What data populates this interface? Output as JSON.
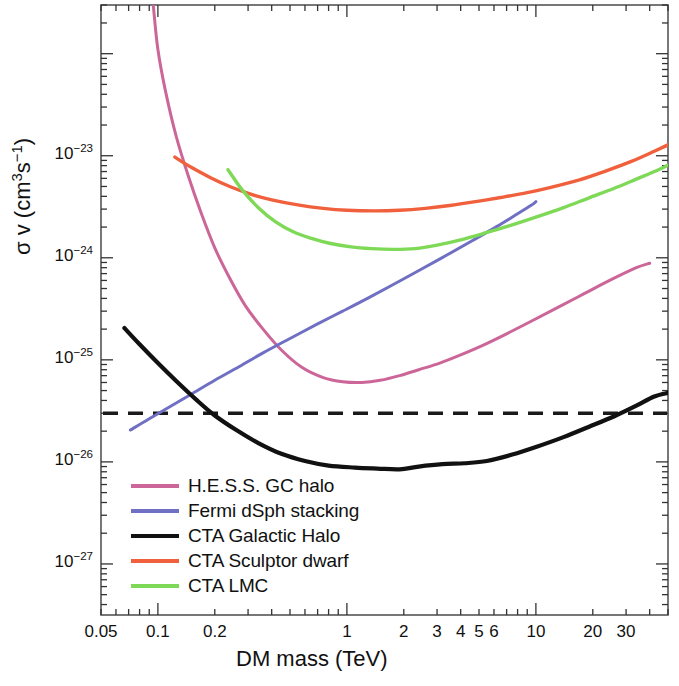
{
  "chart_data": {
    "type": "line",
    "title": "",
    "xlabel": "DM mass (TeV)",
    "ylabel": "σ v (cm3s-1)",
    "ylabel_parts": {
      "sigma": "σ v (cm",
      "exp3": "3",
      "s": "s",
      "expm1": "-1",
      "close": ")"
    },
    "xscale": "log",
    "yscale": "log",
    "xlim": [
      0.05,
      50
    ],
    "ylim": [
      3.16e-28,
      3e-22
    ],
    "grid": false,
    "legend_position": "lower left",
    "xticks": [
      {
        "value": 0.05,
        "label": "0.05"
      },
      {
        "value": 0.1,
        "label": "0.1"
      },
      {
        "value": 0.2,
        "label": "0.2"
      },
      {
        "value": 1,
        "label": "1"
      },
      {
        "value": 2,
        "label": "2"
      },
      {
        "value": 3,
        "label": "3"
      },
      {
        "value": 4,
        "label": "4"
      },
      {
        "value": 5,
        "label": "5"
      },
      {
        "value": 6,
        "label": "6"
      },
      {
        "value": 10,
        "label": "10"
      },
      {
        "value": 20,
        "label": "20"
      },
      {
        "value": 30,
        "label": "30"
      }
    ],
    "yticks": [
      {
        "value": 1e-23,
        "mantissa": "10",
        "exponent": "-23"
      },
      {
        "value": 1e-24,
        "mantissa": "10",
        "exponent": "-24"
      },
      {
        "value": 1e-25,
        "mantissa": "10",
        "exponent": "-25"
      },
      {
        "value": 1e-26,
        "mantissa": "10",
        "exponent": "-26"
      },
      {
        "value": 1e-27,
        "mantissa": "10",
        "exponent": "-27"
      }
    ],
    "annotations": [
      {
        "name": "thermal-relic-line",
        "type": "hline",
        "value": 3e-26,
        "style": "dashed",
        "color": "#1a1a1a"
      }
    ],
    "series": [
      {
        "name": "H.E.S.S. GC halo",
        "color": "#cc6699",
        "width": 3.0,
        "points": [
          [
            0.0945,
            3e-22
          ],
          [
            0.1,
            1.1e-22
          ],
          [
            0.11,
            4.2e-23
          ],
          [
            0.125,
            1.55e-23
          ],
          [
            0.145,
            6.3e-24
          ],
          [
            0.17,
            2.7e-24
          ],
          [
            0.2,
            1.25e-24
          ],
          [
            0.24,
            6.3e-25
          ],
          [
            0.29,
            3.4e-25
          ],
          [
            0.36,
            2e-25
          ],
          [
            0.45,
            1.25e-25
          ],
          [
            0.58,
            8.4e-26
          ],
          [
            0.75,
            6.7e-26
          ],
          [
            0.95,
            6.1e-26
          ],
          [
            1.2,
            6e-26
          ],
          [
            1.5,
            6.3e-26
          ],
          [
            1.9,
            7e-26
          ],
          [
            2.4,
            8e-26
          ],
          [
            3.1,
            9.3e-26
          ],
          [
            4.0,
            1.12e-25
          ],
          [
            5.2,
            1.38e-25
          ],
          [
            7.0,
            1.8e-25
          ],
          [
            9.5,
            2.4e-25
          ],
          [
            13,
            3.25e-25
          ],
          [
            18,
            4.45e-25
          ],
          [
            25,
            6.1e-25
          ],
          [
            34,
            8e-25
          ],
          [
            40,
            8.85e-25
          ]
        ]
      },
      {
        "name": "Fermi dSph stacking",
        "color": "#6f6fc4",
        "width": 3.0,
        "points": [
          [
            0.0715,
            2.05e-26
          ],
          [
            0.09,
            2.65e-26
          ],
          [
            0.115,
            3.45e-26
          ],
          [
            0.15,
            4.6e-26
          ],
          [
            0.2,
            6.3e-26
          ],
          [
            0.27,
            8.6e-26
          ],
          [
            0.36,
            1.17e-25
          ],
          [
            0.5,
            1.62e-25
          ],
          [
            0.7,
            2.25e-25
          ],
          [
            0.95,
            3e-25
          ],
          [
            1.3,
            4.05e-25
          ],
          [
            1.8,
            5.6e-25
          ],
          [
            2.5,
            7.8e-25
          ],
          [
            3.4,
            1.07e-24
          ],
          [
            4.6,
            1.47e-24
          ],
          [
            6.2,
            2.02e-24
          ],
          [
            8.0,
            2.7e-24
          ],
          [
            9.4,
            3.25e-24
          ],
          [
            10.0,
            3.55e-24
          ]
        ]
      },
      {
        "name": "CTA Galactic Halo",
        "color": "#111111",
        "width": 4.2,
        "points": [
          [
            0.0665,
            2.05e-25
          ],
          [
            0.08,
            1.42e-25
          ],
          [
            0.1,
            9.3e-26
          ],
          [
            0.125,
            6.2e-26
          ],
          [
            0.16,
            4.05e-26
          ],
          [
            0.2,
            2.85e-26
          ],
          [
            0.26,
            2.05e-26
          ],
          [
            0.34,
            1.53e-26
          ],
          [
            0.45,
            1.2e-26
          ],
          [
            0.6,
            1.02e-26
          ],
          [
            0.8,
            9.2e-27
          ],
          [
            1.1,
            8.8e-27
          ],
          [
            1.45,
            8.6e-27
          ],
          [
            1.9,
            8.45e-27
          ],
          [
            2.4,
            9e-27
          ],
          [
            3.2,
            9.5e-27
          ],
          [
            4.2,
            9.7e-27
          ],
          [
            5.5,
            1.02e-26
          ],
          [
            7.5,
            1.18e-26
          ],
          [
            10,
            1.4e-26
          ],
          [
            14,
            1.75e-26
          ],
          [
            19,
            2.2e-26
          ],
          [
            26,
            2.8e-26
          ],
          [
            34,
            3.55e-26
          ],
          [
            42,
            4.35e-26
          ],
          [
            50,
            4.75e-26
          ]
        ]
      },
      {
        "name": "CTA Sculptor dwarf",
        "color": "#f0603c",
        "width": 3.4,
        "points": [
          [
            0.123,
            9.7e-24
          ],
          [
            0.15,
            7.7e-24
          ],
          [
            0.19,
            6.1e-24
          ],
          [
            0.24,
            5e-24
          ],
          [
            0.31,
            4.2e-24
          ],
          [
            0.4,
            3.7e-24
          ],
          [
            0.55,
            3.3e-24
          ],
          [
            0.75,
            3.05e-24
          ],
          [
            1.0,
            2.92e-24
          ],
          [
            1.4,
            2.88e-24
          ],
          [
            1.9,
            2.92e-24
          ],
          [
            2.6,
            3.05e-24
          ],
          [
            3.5,
            3.25e-24
          ],
          [
            4.8,
            3.55e-24
          ],
          [
            6.5,
            3.9e-24
          ],
          [
            9.0,
            4.35e-24
          ],
          [
            12,
            4.9e-24
          ],
          [
            17,
            5.8e-24
          ],
          [
            23,
            7e-24
          ],
          [
            32,
            8.8e-24
          ],
          [
            42,
            1.1e-23
          ],
          [
            50,
            1.28e-23
          ],
          [
            52,
            1.35e-23
          ]
        ]
      },
      {
        "name": "CTA LMC",
        "color": "#7ed957",
        "width": 3.4,
        "points": [
          [
            0.235,
            7.3e-24
          ],
          [
            0.28,
            4.6e-24
          ],
          [
            0.34,
            3.1e-24
          ],
          [
            0.42,
            2.25e-24
          ],
          [
            0.52,
            1.8e-24
          ],
          [
            0.65,
            1.55e-24
          ],
          [
            0.82,
            1.38e-24
          ],
          [
            1.05,
            1.28e-24
          ],
          [
            1.35,
            1.23e-24
          ],
          [
            1.75,
            1.21e-24
          ],
          [
            2.3,
            1.23e-24
          ],
          [
            3.0,
            1.33e-24
          ],
          [
            4.0,
            1.5e-24
          ],
          [
            5.4,
            1.75e-24
          ],
          [
            7.2,
            2.05e-24
          ],
          [
            10,
            2.5e-24
          ],
          [
            14,
            3.1e-24
          ],
          [
            19,
            3.85e-24
          ],
          [
            26,
            4.8e-24
          ],
          [
            34,
            5.9e-24
          ],
          [
            44,
            7.2e-24
          ],
          [
            52,
            8.4e-24
          ]
        ]
      }
    ]
  },
  "legend": {
    "items": [
      {
        "label": "H.E.S.S. GC halo",
        "color": "#cc6699"
      },
      {
        "label": "Fermi dSph stacking",
        "color": "#6f6fc4"
      },
      {
        "label": "CTA Galactic Halo",
        "color": "#111111"
      },
      {
        "label": "CTA Sculptor dwarf",
        "color": "#f0603c"
      },
      {
        "label": "CTA LMC",
        "color": "#7ed957"
      }
    ]
  }
}
